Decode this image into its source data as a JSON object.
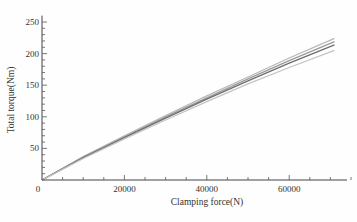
{
  "chart_data": {
    "type": "line",
    "title": "",
    "xlabel": "Clamping force(N)",
    "ylabel": "Total torque(Nm)",
    "xlim": [
      0,
      76000
    ],
    "ylim": [
      0,
      260
    ],
    "x_ticks": [
      0,
      20000,
      40000,
      60000
    ],
    "x_tick_labels": [
      "0",
      "20000",
      "40000",
      "60000"
    ],
    "y_ticks": [
      50,
      100,
      150,
      200,
      250
    ],
    "y_tick_labels": [
      "50",
      "100",
      "150",
      "200",
      "250"
    ],
    "grid": false,
    "legend": null,
    "x": [
      0,
      10000,
      20000,
      30000,
      40000,
      50000,
      60000,
      71000
    ],
    "series": [
      {
        "name": "curve 1",
        "color": "#b8b8b8",
        "values": [
          0,
          37,
          70,
          102,
          133,
          163,
          193,
          224
        ]
      },
      {
        "name": "curve 2",
        "color": "#9a9a9a",
        "values": [
          0,
          36,
          68,
          100,
          130,
          160,
          189,
          219
        ]
      },
      {
        "name": "curve 3",
        "color": "#6e6e6e",
        "values": [
          0,
          35,
          67,
          98,
          128,
          157,
          185,
          214
        ]
      },
      {
        "name": "curve 4",
        "color": "#c4c4c4",
        "values": [
          0,
          34,
          65,
          95,
          124,
          152,
          178,
          205
        ]
      }
    ]
  }
}
